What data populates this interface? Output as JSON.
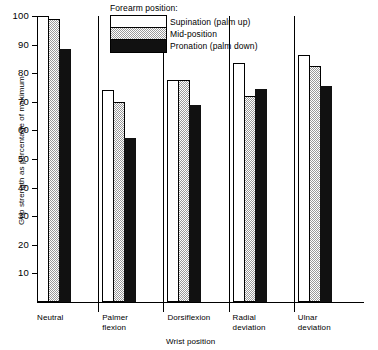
{
  "legend": {
    "title": "Forearm position:",
    "entries": [
      {
        "key": "supination",
        "label": "Supination (palm up)",
        "color": "#ffffff"
      },
      {
        "key": "mid",
        "label": "Mid-position",
        "color": "#d8d8d8"
      },
      {
        "key": "pronation",
        "label": "Pronation (palm down)",
        "color": "#111111"
      }
    ]
  },
  "chart_data": {
    "type": "bar",
    "title": "",
    "xlabel": "Wrist position",
    "ylabel": "Grip strength as percentage of maximum",
    "categories": [
      "Neutral",
      "Palmer flexion",
      "Dorsiflexion",
      "Radial deviation",
      "Ulnar deviation"
    ],
    "series": [
      {
        "name": "Supination (palm up)",
        "values": [
          100,
          74,
          77.5,
          83.5,
          86.5
        ]
      },
      {
        "name": "Mid-position",
        "values": [
          99,
          70,
          77.5,
          72,
          82.5
        ]
      },
      {
        "name": "Pronation (palm down)",
        "values": [
          88.5,
          57.5,
          69,
          74.5,
          75.5
        ]
      }
    ],
    "ylim": [
      0,
      100
    ],
    "yticks": [
      10,
      20,
      30,
      40,
      50,
      60,
      70,
      80,
      90,
      100
    ],
    "grid": false,
    "legend_position": "top-center"
  }
}
